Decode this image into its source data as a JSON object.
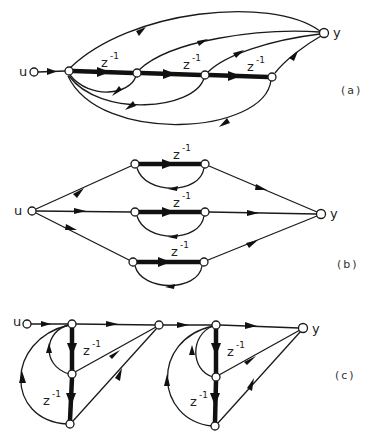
{
  "figure": {
    "subfigures": [
      {
        "id": "a",
        "label": "(a)",
        "input_label": "u",
        "output_label": "y",
        "delay_labels": [
          "z",
          "z",
          "z"
        ],
        "delay_exponent": "-1"
      },
      {
        "id": "b",
        "label": "(b)",
        "input_label": "u",
        "output_label": "y",
        "delay_labels": [
          "z",
          "z",
          "z"
        ],
        "delay_exponent": "-1"
      },
      {
        "id": "c",
        "label": "(c)",
        "input_label": "u",
        "output_label": "y",
        "delay_labels": [
          "z",
          "z",
          "z",
          "z"
        ],
        "delay_exponent": "-1"
      }
    ]
  },
  "colors": {
    "line": "#1a1a1a",
    "background": "#ffffff"
  }
}
